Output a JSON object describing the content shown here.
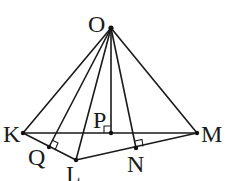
{
  "diagram": {
    "type": "geometry-pyramid",
    "points": {
      "O": {
        "label": "O",
        "x": 111,
        "y": 28
      },
      "K": {
        "label": "K",
        "x": 23,
        "y": 133
      },
      "M": {
        "label": "M",
        "x": 197,
        "y": 133
      },
      "P": {
        "label": "P",
        "x": 111,
        "y": 133
      },
      "Q": {
        "label": "Q",
        "x": 49,
        "y": 147
      },
      "L": {
        "label": "L",
        "x": 76,
        "y": 160
      },
      "N": {
        "label": "N",
        "x": 136,
        "y": 148
      }
    },
    "segments": [
      [
        "O",
        "K"
      ],
      [
        "O",
        "Q"
      ],
      [
        "O",
        "L"
      ],
      [
        "O",
        "P"
      ],
      [
        "O",
        "N"
      ],
      [
        "O",
        "M"
      ],
      [
        "K",
        "M"
      ],
      [
        "K",
        "L"
      ],
      [
        "L",
        "M"
      ]
    ],
    "right_angles": [
      "P",
      "Q",
      "N"
    ],
    "stroke_color": "#1a1a1a"
  }
}
